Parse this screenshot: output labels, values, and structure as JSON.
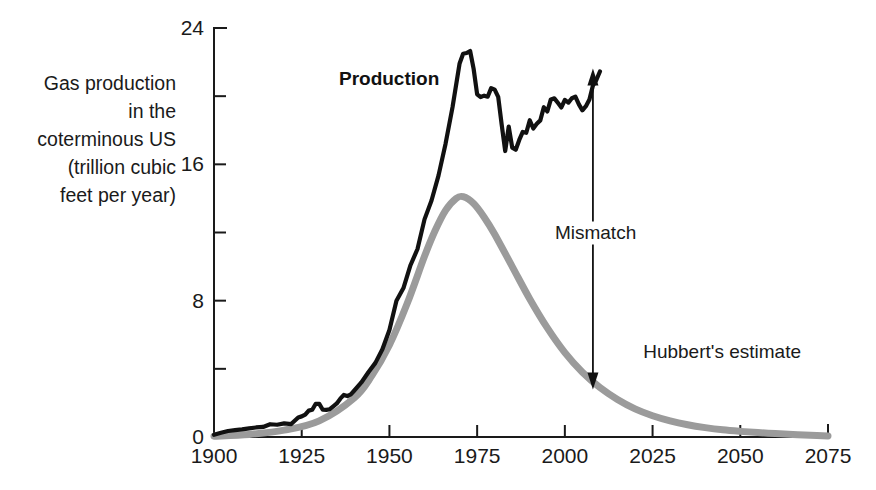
{
  "chart_data": {
    "type": "line",
    "title": "",
    "xlabel": "",
    "ylabel": "Gas production in the coterminous US (trillion cubic feet per year)",
    "ylabel_lines": [
      "Gas production",
      "in the",
      "coterminous US",
      "(trillion cubic",
      "feet per year)"
    ],
    "xlim": [
      1900,
      2075
    ],
    "ylim": [
      0,
      24
    ],
    "grid": false,
    "legend_position": "inline-annotations",
    "xticks": [
      1900,
      1925,
      1950,
      1975,
      2000,
      2025,
      2050,
      2075
    ],
    "xtick_labels": [
      "1900",
      "1925",
      "1950",
      "1975",
      "2000",
      "2025",
      "2050",
      "2075"
    ],
    "xminor_ticks": [],
    "yticks": [
      0,
      8,
      16,
      24
    ],
    "ytick_labels": [
      "0",
      "8",
      "16",
      "24"
    ],
    "yminor_ticks": [
      4,
      12,
      20
    ],
    "series": [
      {
        "name": "Production",
        "label": "Production",
        "color": "#111111",
        "style": "solid-bold",
        "x": [
          1900,
          1902,
          1904,
          1906,
          1908,
          1910,
          1912,
          1914,
          1916,
          1918,
          1920,
          1922,
          1924,
          1925,
          1926,
          1927,
          1928,
          1929,
          1930,
          1931,
          1932,
          1933,
          1934,
          1935,
          1936,
          1937,
          1938,
          1939,
          1940,
          1942,
          1944,
          1946,
          1948,
          1950,
          1952,
          1954,
          1956,
          1958,
          1960,
          1962,
          1964,
          1966,
          1968,
          1970,
          1971,
          1972,
          1973,
          1974,
          1975,
          1976,
          1977,
          1978,
          1979,
          1980,
          1981,
          1982,
          1983,
          1984,
          1985,
          1986,
          1987,
          1988,
          1989,
          1990,
          1991,
          1992,
          1993,
          1994,
          1995,
          1996,
          1997,
          1998,
          1999,
          2000,
          2001,
          2002,
          2003,
          2004,
          2005,
          2006,
          2007,
          2008,
          2009,
          2010
        ],
        "y": [
          0.13,
          0.25,
          0.35,
          0.4,
          0.45,
          0.51,
          0.56,
          0.59,
          0.75,
          0.72,
          0.8,
          0.76,
          1.15,
          1.21,
          1.31,
          1.55,
          1.6,
          1.95,
          1.94,
          1.6,
          1.59,
          1.63,
          1.8,
          1.97,
          2.25,
          2.47,
          2.4,
          2.5,
          2.73,
          3.2,
          3.8,
          4.35,
          5.15,
          6.28,
          8.0,
          8.74,
          10.08,
          11.03,
          12.77,
          13.88,
          15.35,
          17.21,
          19.37,
          21.92,
          22.49,
          22.53,
          22.65,
          21.6,
          20.11,
          19.95,
          20.03,
          19.97,
          20.47,
          20.38,
          19.96,
          18.32,
          16.78,
          18.22,
          16.98,
          16.86,
          17.43,
          17.9,
          17.85,
          18.59,
          18.1,
          18.38,
          18.58,
          19.35,
          19.1,
          19.81,
          19.87,
          19.61,
          19.34,
          19.78,
          19.62,
          19.88,
          19.97,
          19.52,
          19.17,
          19.41,
          19.8,
          20.62,
          20.96,
          21.45
        ],
        "annotation": {
          "text": "Production",
          "x": 1955,
          "y": 21.0
        }
      },
      {
        "name": "Hubbert's estimate",
        "label": "Hubbert's estimate",
        "color": "#9b9b9b",
        "style": "solid-thick-gray",
        "x": [
          1900,
          1910,
          1920,
          1930,
          1940,
          1945,
          1950,
          1955,
          1960,
          1963,
          1966,
          1969,
          1971,
          1974,
          1977,
          1980,
          1985,
          1990,
          1995,
          2000,
          2005,
          2010,
          2015,
          2020,
          2025,
          2030,
          2035,
          2040,
          2045,
          2050,
          2055,
          2060,
          2065,
          2070,
          2075
        ],
        "y": [
          0.05,
          0.15,
          0.4,
          0.95,
          2.3,
          3.6,
          5.4,
          7.8,
          10.6,
          12.1,
          13.3,
          14.0,
          14.1,
          13.7,
          12.9,
          11.9,
          10.0,
          8.1,
          6.4,
          4.95,
          3.8,
          2.9,
          2.2,
          1.65,
          1.25,
          0.95,
          0.72,
          0.55,
          0.42,
          0.33,
          0.26,
          0.2,
          0.15,
          0.1,
          0.06
        ],
        "annotation": {
          "text": "Hubbert's estimate",
          "x": 2040,
          "y": 5.0
        }
      }
    ],
    "annotations": [
      {
        "name": "mismatch",
        "text": "Mismatch",
        "type": "double-arrow",
        "x": 2008,
        "y_top": 21.5,
        "y_bottom": 2.9,
        "label_x": 2009,
        "label_y": 12.0
      }
    ]
  },
  "labels": {
    "production": "Production",
    "hubbert": "Hubbert's estimate",
    "mismatch": "Mismatch"
  },
  "colors": {
    "production": "#111111",
    "hubbert": "#9b9b9b",
    "axis": "#1a1a1a",
    "background": "#ffffff"
  }
}
